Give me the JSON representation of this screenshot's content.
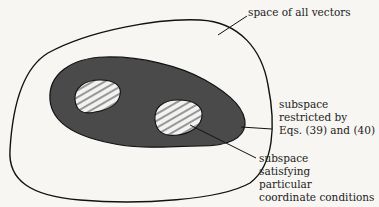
{
  "diagram": {
    "labels": {
      "all_vectors": "space of all vectors",
      "restricted": [
        "subspace",
        "restricted by",
        "Eqs. (39) and (40)"
      ],
      "coordinate": [
        "subspace",
        "satisfying",
        "particular",
        "coordinate conditions"
      ]
    },
    "colors": {
      "background": "#f7f6f3",
      "restricted_fill": "#4a4a4a",
      "hatch_fill": "#f2f2f0",
      "hatch_lines": "#666666",
      "stroke": "#111111"
    }
  }
}
